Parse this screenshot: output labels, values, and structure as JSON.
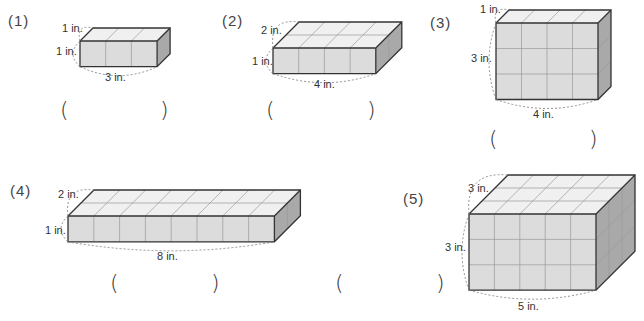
{
  "problems": [
    {
      "number": "(1)",
      "length_label": "3 in.",
      "width_label": "1 in.",
      "height_label": "1 in.",
      "length": 3,
      "width": 1,
      "height": 1,
      "answer_open": "(",
      "answer_close": ")",
      "answer": ""
    },
    {
      "number": "(2)",
      "length_label": "4 in.",
      "width_label": "2 in.",
      "height_label": "1 in.",
      "length": 4,
      "width": 2,
      "height": 1,
      "answer_open": "(",
      "answer_close": ")",
      "answer": ""
    },
    {
      "number": "(3)",
      "length_label": "4 in.",
      "width_label": "1 in.",
      "height_label": "3 in.",
      "length": 4,
      "width": 1,
      "height": 3,
      "answer_open": "(",
      "answer_close": ")",
      "answer": ""
    },
    {
      "number": "(4)",
      "length_label": "8 in.",
      "width_label": "2 in.",
      "height_label": "1 in.",
      "length": 8,
      "width": 2,
      "height": 1,
      "answer_open": "(",
      "answer_close": ")",
      "answer": ""
    },
    {
      "number": "(5)",
      "length_label": "5 in.",
      "width_label": "3 in.",
      "height_label": "3 in.",
      "length": 5,
      "width": 3,
      "height": 3,
      "answer_open": "(",
      "answer_close": ")",
      "answer": ""
    }
  ],
  "colors": {
    "front": "#dcdcdc",
    "top": "#f0f0f0",
    "side": "#a9a9a9",
    "edge": "#333333",
    "grid": "#9a9a9a",
    "dash": "#777777"
  }
}
